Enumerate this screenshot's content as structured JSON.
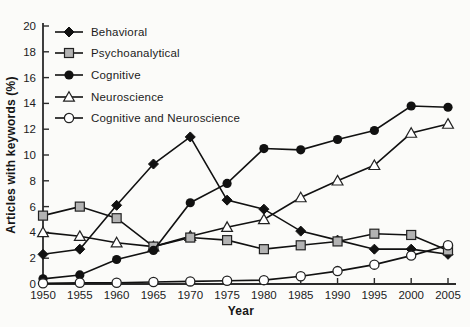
{
  "figure": {
    "background": "#fbfbf9",
    "axis_color": "#2b2b2b",
    "text_color": "#1c1c1c"
  },
  "chart_data": {
    "type": "line",
    "title": "",
    "xlabel": "Year",
    "ylabel": "Articles with keywords (%)",
    "x": [
      1950,
      1955,
      1960,
      1965,
      1970,
      1975,
      1980,
      1985,
      1990,
      1995,
      2000,
      2005
    ],
    "xlim": [
      1950,
      2005
    ],
    "ylim": [
      0,
      20
    ],
    "ytick_step": 2,
    "xtick_step": 5,
    "grid": false,
    "legend_position": "top-left-inside",
    "series": [
      {
        "name": "Behavioral",
        "marker": "filled-diamond",
        "line_color": "#111111",
        "marker_fill": "#111111",
        "values": [
          2.3,
          2.7,
          6.1,
          9.3,
          11.4,
          6.5,
          5.8,
          4.1,
          3.4,
          2.7,
          2.7,
          2.3
        ]
      },
      {
        "name": "Psychoanalytical",
        "marker": "gray-square",
        "line_color": "#111111",
        "marker_fill": "#b3b3b3",
        "values": [
          5.3,
          6.0,
          5.1,
          2.9,
          3.6,
          3.4,
          2.7,
          3.0,
          3.3,
          3.9,
          3.8,
          2.6
        ]
      },
      {
        "name": "Cognitive",
        "marker": "filled-circle",
        "line_color": "#111111",
        "marker_fill": "#111111",
        "values": [
          0.4,
          0.7,
          1.9,
          2.6,
          6.3,
          7.8,
          10.5,
          10.4,
          11.2,
          11.9,
          13.8,
          13.7
        ]
      },
      {
        "name": "Neuroscience",
        "marker": "open-triangle",
        "line_color": "#111111",
        "marker_fill": "#ffffff",
        "values": [
          4.0,
          3.7,
          3.2,
          2.9,
          3.7,
          4.4,
          5.0,
          6.7,
          8.0,
          9.2,
          11.7,
          12.4
        ]
      },
      {
        "name": "Cognitive and Neuroscience",
        "marker": "open-circle",
        "line_color": "#111111",
        "marker_fill": "#ffffff",
        "values": [
          0.05,
          0.1,
          0.1,
          0.15,
          0.2,
          0.25,
          0.3,
          0.6,
          1.0,
          1.5,
          2.2,
          3.0
        ]
      }
    ]
  }
}
